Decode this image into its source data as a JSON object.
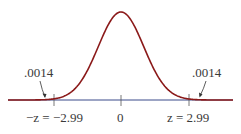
{
  "chart_data": {
    "type": "area",
    "title": "",
    "xlabel": "",
    "ylabel": "",
    "x_ticks": [
      {
        "value": -2.99,
        "label": "−z = −2.99"
      },
      {
        "value": 0,
        "label": "0"
      },
      {
        "value": 2.99,
        "label": "z = 2.99"
      }
    ],
    "tail_areas": [
      {
        "side": "left",
        "bound": -2.99,
        "area": 0.0014,
        "label": ".0014"
      },
      {
        "side": "right",
        "bound": 2.99,
        "area": 0.0014,
        "label": ".0014"
      }
    ],
    "xlim": [
      -4.1,
      4.1
    ],
    "grid": false,
    "colors": {
      "curve": "#8b1a1a",
      "axis": "#3b4a8a",
      "tail_fill": "#f2c4c4"
    }
  },
  "labels": {
    "left_area": ".0014",
    "right_area": ".0014",
    "left_tick": "−z = −2.99",
    "center_tick": "0",
    "right_tick": "z = 2.99"
  }
}
